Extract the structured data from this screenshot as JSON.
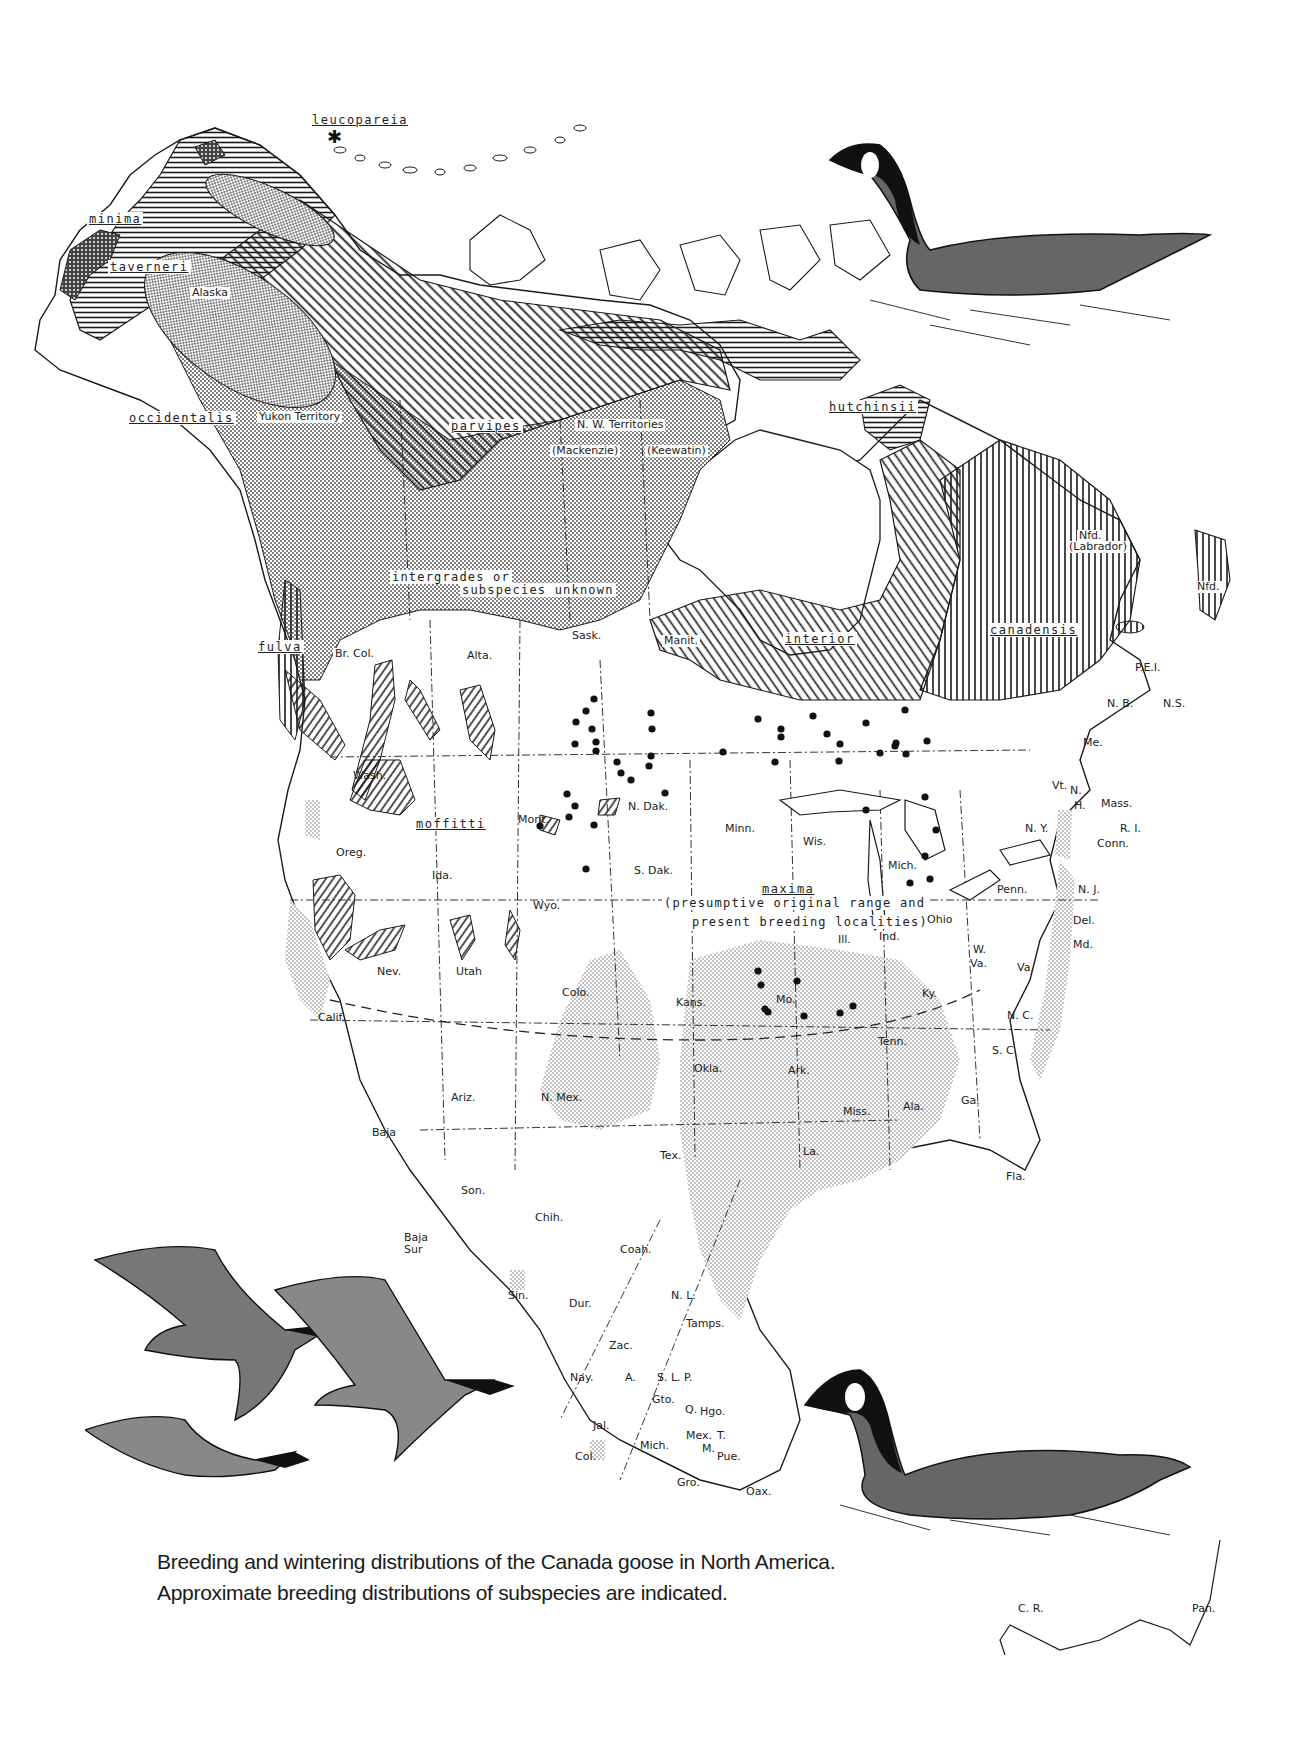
{
  "figure": {
    "caption": "Breeding and wintering distributions of the Canada goose in North America. Approximate breeding distributions of subspecies are indicated.",
    "colors": {
      "ink": "#1a1a1a",
      "paper": "#ffffff",
      "stipple": "#9a9a9a",
      "wintering_fill": "#d4d4d4"
    }
  },
  "subspecies": [
    {
      "name": "leucopareia",
      "pattern": "coarse-stipple",
      "marker": "asterisk"
    },
    {
      "name": "minima",
      "pattern": "dense-crosshatch"
    },
    {
      "name": "taverneri",
      "pattern": "horizontal-hatch"
    },
    {
      "name": "occidentalis",
      "pattern": "stipple"
    },
    {
      "name": "fulva",
      "pattern": "vertical-hatch"
    },
    {
      "name": "parvipes",
      "pattern": "diagonal-hatch"
    },
    {
      "name": "hutchinsii",
      "pattern": "horizontal-hatch"
    },
    {
      "name": "interior",
      "pattern": "diagonal-hatch"
    },
    {
      "name": "canadensis",
      "pattern": "vertical-hatch"
    },
    {
      "name": "moffitti",
      "pattern": "diagonal-hatch-patches"
    },
    {
      "name": "maxima",
      "pattern": "dots",
      "note": "(presumptive original range and present breeding localities)"
    }
  ],
  "annotations": {
    "intergrades_line1": "intergrades  or",
    "intergrades_line2": "subspecies unknown",
    "maxima_line1": "(presumptive original range and",
    "maxima_line2": "present breeding localities)"
  },
  "regions": {
    "alaska": "Alaska",
    "yukon": "Yukon Territory",
    "nwt": "N. W. Territories",
    "mackenzie": "(Mackenzie)",
    "keewatin": "(Keewatin)",
    "nfd_lab_1": "Nfd.",
    "nfd_lab_2": "(Labrador)",
    "nfd": "Nfd.",
    "brcol": "Br. Col.",
    "alta": "Alta.",
    "sask": "Sask.",
    "manit": "Manit.",
    "pei": "P.E.I.",
    "nb": "N. B.",
    "ns": "N.S.",
    "me": "Me.",
    "vt": "Vt.",
    "nh1": "N.",
    "nh2": "H.",
    "mass": "Mass.",
    "ri": "R. I.",
    "conn": "Conn.",
    "ny": "N. Y.",
    "nj": "N. J.",
    "penn": "Penn.",
    "del": "Del.",
    "md": "Md.",
    "wva1": "W.",
    "wva2": "Va.",
    "va": "Va.",
    "nc": "N. C.",
    "sc": "S. C.",
    "ga": "Ga.",
    "fla": "Fla.",
    "ala": "Ala.",
    "miss": "Miss.",
    "la": "La.",
    "tenn": "Tenn.",
    "ky": "Ky.",
    "ohio": "Ohio",
    "ind": "Ind.",
    "ill": "Ill.",
    "mich": "Mich.",
    "wis": "Wis.",
    "minn": "Minn.",
    "ndak": "N. Dak.",
    "sdak": "S. Dak.",
    "mont": "Mont.",
    "wyo": "Wyo.",
    "ida": "Ida.",
    "wash": "Wash.",
    "oreg": "Oreg.",
    "calif": "Calif.",
    "nev": "Nev.",
    "utah": "Utah",
    "colo": "Colo.",
    "ariz": "Ariz.",
    "nmex": "N. Mex.",
    "kans": "Kans.",
    "okla": "Okla.",
    "tex": "Tex.",
    "mo": "Mo.",
    "ark": "Ark.",
    "baja": "Baja",
    "bajasur1": "Baja",
    "bajasur2": "Sur",
    "son": "Son.",
    "chih": "Chih.",
    "coah": "Coah.",
    "nl": "N. L.",
    "tamps": "Tamps.",
    "sin": "Sin.",
    "dur": "Dur.",
    "zac": "Zac.",
    "nay": "Nay.",
    "a": "A.",
    "slp": "S. L. P.",
    "gto": "Gto.",
    "q": "Q.",
    "hgo": "Hgo.",
    "jal": "Jal.",
    "col": "Col.",
    "mich_mx": "Mich.",
    "mex": "Mex.",
    "t": "T.",
    "m": "M.",
    "pue": "Pue.",
    "gro": "Gro.",
    "oax": "Oax.",
    "cr": "C. R.",
    "pan": "Pan."
  },
  "illustrations": [
    {
      "id": "swimming-goose-top",
      "subject": "Canada goose swimming (small race)"
    },
    {
      "id": "flying-geese",
      "subject": "three Canada geese in flight"
    },
    {
      "id": "swimming-goose-bottom",
      "subject": "Canada goose swimming (large race)"
    }
  ],
  "maxima_breeding_dots": [
    [
      594,
      699
    ],
    [
      586,
      711
    ],
    [
      576,
      722
    ],
    [
      592,
      729
    ],
    [
      596,
      742
    ],
    [
      651,
      713
    ],
    [
      652,
      729
    ],
    [
      651,
      756
    ],
    [
      649,
      766
    ],
    [
      617,
      762
    ],
    [
      621,
      773
    ],
    [
      631,
      780
    ],
    [
      665,
      793
    ],
    [
      567,
      794
    ],
    [
      596,
      751
    ],
    [
      575,
      744
    ],
    [
      540,
      826
    ],
    [
      569,
      817
    ],
    [
      586,
      869
    ],
    [
      575,
      806
    ],
    [
      594,
      825
    ],
    [
      723,
      752
    ],
    [
      758,
      719
    ],
    [
      781,
      729
    ],
    [
      781,
      737
    ],
    [
      775,
      762
    ],
    [
      813,
      716
    ],
    [
      827,
      734
    ],
    [
      866,
      723
    ],
    [
      905,
      710
    ],
    [
      866,
      810
    ],
    [
      839,
      761
    ],
    [
      840,
      744
    ],
    [
      896,
      743
    ],
    [
      906,
      754
    ],
    [
      927,
      741
    ],
    [
      925,
      797
    ],
    [
      936,
      830
    ],
    [
      925,
      856
    ],
    [
      910,
      883
    ],
    [
      930,
      879
    ],
    [
      895,
      746
    ],
    [
      880,
      753
    ],
    [
      758,
      971
    ],
    [
      761,
      985
    ],
    [
      797,
      981
    ],
    [
      765,
      1009
    ],
    [
      768,
      1012
    ],
    [
      804,
      1016
    ],
    [
      840,
      1013
    ],
    [
      853,
      1006
    ]
  ]
}
